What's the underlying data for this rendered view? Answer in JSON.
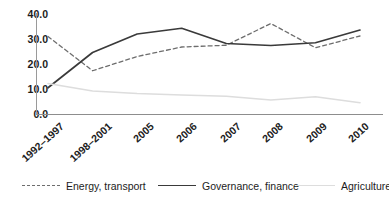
{
  "chart_data": {
    "type": "line",
    "title": "",
    "xlabel": "",
    "ylabel": "",
    "ylim": [
      0.0,
      40.0
    ],
    "ytick_labels": [
      "40.0",
      "30.0",
      "20.0",
      "10.0",
      "0.0"
    ],
    "ytick_values": [
      40.0,
      30.0,
      20.0,
      10.0,
      0.0
    ],
    "grid": false,
    "legend_position": "bottom",
    "categories": [
      "1992–1997",
      "1998–2001",
      "2005",
      "2006",
      "2007",
      "2008",
      "2009",
      "2010"
    ],
    "series": [
      {
        "name": "Energy, transport",
        "style": "dashed",
        "color": "#6d6d6d",
        "values": [
          31.0,
          17.3,
          23.0,
          26.8,
          27.5,
          36.2,
          26.5,
          31.2
        ]
      },
      {
        "name": "Governance, finance",
        "style": "solid",
        "color": "#3a3a3a",
        "values": [
          10.5,
          24.6,
          32.0,
          34.3,
          28.2,
          27.4,
          28.5,
          33.6
        ]
      },
      {
        "name": "Agriculture",
        "style": "solid-light",
        "color": "#dddddd",
        "values": [
          12.2,
          9.2,
          8.2,
          7.6,
          7.1,
          5.6,
          6.9,
          4.5
        ]
      }
    ]
  },
  "axis": {
    "y_ticks": [
      {
        "label": "40.0",
        "value": 40.0
      },
      {
        "label": "30.0",
        "value": 30.0
      },
      {
        "label": "20.0",
        "value": 20.0
      },
      {
        "label": "10.0",
        "value": 10.0
      },
      {
        "label": "0.0",
        "value": 0.0
      }
    ],
    "x_ticks": [
      {
        "label": "1992–1997"
      },
      {
        "label": "1998–2001"
      },
      {
        "label": "2005"
      },
      {
        "label": "2006"
      },
      {
        "label": "2007"
      },
      {
        "label": "2008"
      },
      {
        "label": "2009"
      },
      {
        "label": "2010"
      }
    ]
  },
  "legend": {
    "items": [
      {
        "label": "Energy, transport",
        "style": "dashed",
        "color": "#6d6d6d"
      },
      {
        "label": "Governance, finance",
        "style": "solid",
        "color": "#3a3a3a"
      },
      {
        "label": "Agriculture",
        "style": "solid-light",
        "color": "#dddddd"
      }
    ]
  }
}
